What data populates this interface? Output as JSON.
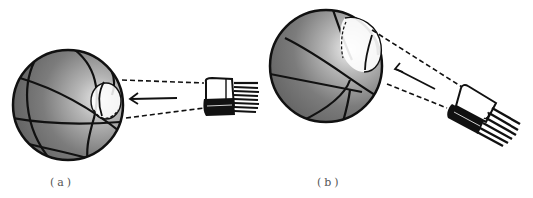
{
  "figure": {
    "panels": [
      {
        "id": "a",
        "label": "(a)",
        "incidence": "perpendicular",
        "light_spot": "small"
      },
      {
        "id": "b",
        "label": "(b)",
        "incidence": "oblique",
        "light_spot": "elongated"
      }
    ],
    "icons": {
      "ball": "basketball-icon",
      "light_source": "flashlight-icon",
      "direction": "arrow-left-icon"
    },
    "colors": {
      "ball_fill": "#7a7a7a",
      "ball_highlight": "#d8d8d8",
      "ink": "#111111",
      "background": "#ffffff"
    }
  }
}
